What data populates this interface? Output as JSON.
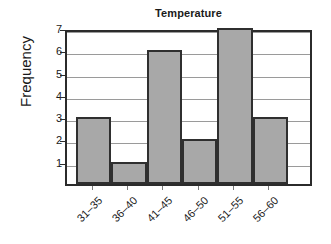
{
  "chart_data": {
    "type": "bar",
    "title": "Temperature",
    "xlabel": "",
    "ylabel": "Frequency",
    "categories": [
      "31–35",
      "36–40",
      "41–45",
      "46–50",
      "51–55",
      "56–60"
    ],
    "values": [
      3,
      1,
      6,
      2,
      7,
      3
    ],
    "ylim": [
      0,
      7
    ],
    "yticks": [
      1,
      2,
      3,
      4,
      5,
      6,
      7
    ],
    "ytick_labels": [
      "1",
      "2",
      "3",
      "4",
      "5",
      "6",
      "7"
    ],
    "grid": true,
    "grid_axis": "y",
    "legend": false,
    "legend_position": "none",
    "bar_style": "histogram-adjacent",
    "xtick_label_rotation": -45,
    "ylabel_rotation": 90,
    "colors": {
      "bar_fill": "#a8a8a8",
      "bar_edge": "#2f2f2f",
      "gridline": "#9a9a9a",
      "axis": "#2b2b2b",
      "text": "#1a1a1a",
      "background": "#ffffff"
    }
  }
}
